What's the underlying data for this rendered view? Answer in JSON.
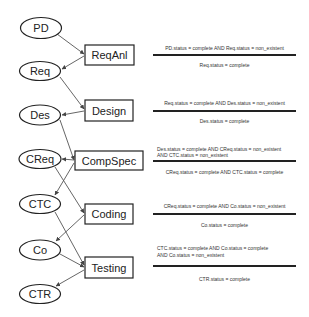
{
  "diagram": {
    "places": [
      {
        "id": "PD",
        "label": "PD",
        "cx": 41,
        "cy": 28
      },
      {
        "id": "Req",
        "label": "Req",
        "cx": 40,
        "cy": 71
      },
      {
        "id": "Des",
        "label": "Des",
        "cx": 40,
        "cy": 115
      },
      {
        "id": "CReq",
        "label": "CReq",
        "cx": 40,
        "cy": 159
      },
      {
        "id": "CTC",
        "label": "CTC",
        "cx": 40,
        "cy": 204
      },
      {
        "id": "Co",
        "label": "Co",
        "cx": 40,
        "cy": 250
      },
      {
        "id": "CTR",
        "label": "CTR",
        "cx": 40,
        "cy": 294
      }
    ],
    "transitions": [
      {
        "id": "ReqAnl",
        "label": "ReqAnl"
      },
      {
        "id": "Design",
        "label": "Design"
      },
      {
        "id": "CompSpec",
        "label": "CompSpec"
      },
      {
        "id": "Coding",
        "label": "Coding"
      },
      {
        "id": "Testing",
        "label": "Testing"
      }
    ],
    "rules": [
      {
        "transition": "ReqAnl",
        "precondition": [
          "PD.status = complete AND Req.status = non_existent"
        ],
        "postcondition": "Req.status = complete"
      },
      {
        "transition": "Design",
        "precondition": [
          "Req.status = complete AND Des.status = non_existent"
        ],
        "postcondition": "Des.status = complete"
      },
      {
        "transition": "CompSpec",
        "precondition": [
          "Des.status = complete AND CReq.status = non_existent",
          "AND CTC.status = non_existent"
        ],
        "postcondition": "CReq.status = complete AND CTC.status = complete"
      },
      {
        "transition": "Coding",
        "precondition": [
          "CReq.status = complete AND Co.status = non_existent"
        ],
        "postcondition": "Co.status = complete"
      },
      {
        "transition": "Testing",
        "precondition": [
          "CTC.status = complete AND Co.status = complete",
          "AND Co.status = non_existent"
        ],
        "postcondition": "CTR.status = complete"
      }
    ],
    "arcs": [
      {
        "from": "PD",
        "to": "ReqAnl"
      },
      {
        "from": "ReqAnl",
        "to": "Req"
      },
      {
        "from": "Req",
        "to": "Design"
      },
      {
        "from": "Design",
        "to": "Des"
      },
      {
        "from": "Des",
        "to": "CompSpec"
      },
      {
        "from": "CompSpec",
        "to": "CReq"
      },
      {
        "from": "CompSpec",
        "to": "CTC"
      },
      {
        "from": "CReq",
        "to": "Coding"
      },
      {
        "from": "Coding",
        "to": "Co"
      },
      {
        "from": "CTC",
        "to": "Testing"
      },
      {
        "from": "Co",
        "to": "Testing"
      },
      {
        "from": "Testing",
        "to": "CTR"
      }
    ]
  }
}
